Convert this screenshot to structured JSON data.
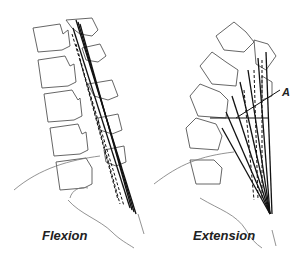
{
  "figure": {
    "panels": [
      {
        "id": "flexion",
        "label": "Flexion"
      },
      {
        "id": "extension",
        "label": "Extension"
      }
    ],
    "annotations": [
      {
        "id": "A",
        "text": "A"
      }
    ]
  },
  "colors": {
    "background": "#ffffff",
    "line": "#111111",
    "bone_outline": "#555555"
  }
}
